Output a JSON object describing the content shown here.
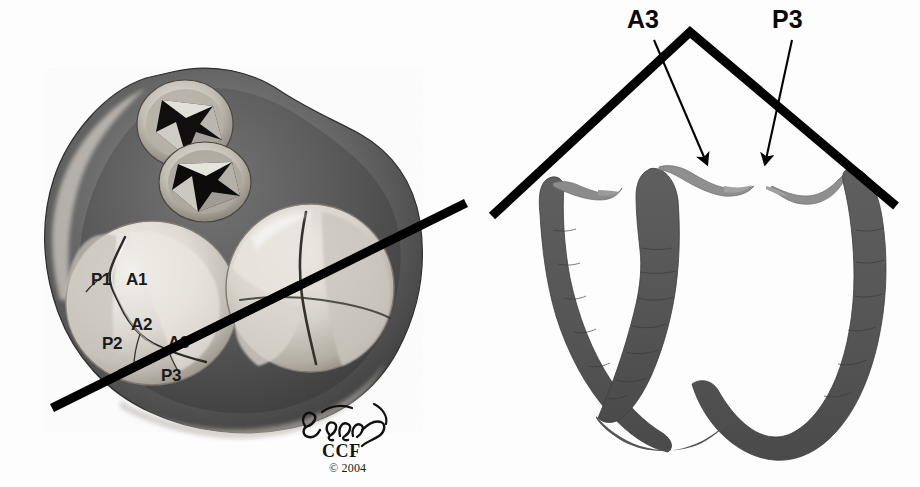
{
  "figure": {
    "background_color": "#fdfdfd",
    "ink_color": "#000000"
  },
  "left_panel": {
    "name": "cardiac-base-view",
    "description": "Surgeon's view of the cardiac base showing the mitral and tricuspid valves with aortic and pulmonic valve orifices",
    "section_line": {
      "label": "section-plane-line",
      "from_x": 52,
      "from_y": 408,
      "to_x": 466,
      "to_y": 203,
      "width_px": 9,
      "color": "#000000"
    },
    "labels": [
      {
        "text": "P1",
        "x": 91,
        "y": 285
      },
      {
        "text": "A1",
        "x": 126,
        "y": 285
      },
      {
        "text": "A2",
        "x": 131,
        "y": 330
      },
      {
        "text": "P2",
        "x": 102,
        "y": 349
      },
      {
        "text": "A3",
        "x": 168,
        "y": 348
      },
      {
        "text": "P3",
        "x": 161,
        "y": 381
      }
    ]
  },
  "right_panel": {
    "name": "mitral-valve-cross-section",
    "description": "Cross-section through the heart at the section plane showing the A3 and P3 leaflet scallops",
    "tent_line": {
      "label": "section-indicator-tent",
      "left_x": 492,
      "left_y": 216,
      "apex_x": 690,
      "apex_y": 32,
      "right_x": 896,
      "right_y": 206,
      "width_px": 9,
      "color": "#000000"
    },
    "labels": [
      {
        "text": "A3",
        "x": 630,
        "y": 28,
        "arrow_from_x": 654,
        "arrow_from_y": 40,
        "arrow_to_x": 707,
        "arrow_to_y": 164
      },
      {
        "text": "P3",
        "x": 775,
        "y": 28,
        "arrow_from_x": 792,
        "arrow_from_y": 40,
        "arrow_to_x": 765,
        "arrow_to_y": 164
      }
    ]
  },
  "signature": {
    "artist_mark": "ℐ Halasz",
    "institution": "CCF",
    "copyright": "© 2004",
    "x": 300,
    "y": 415
  }
}
